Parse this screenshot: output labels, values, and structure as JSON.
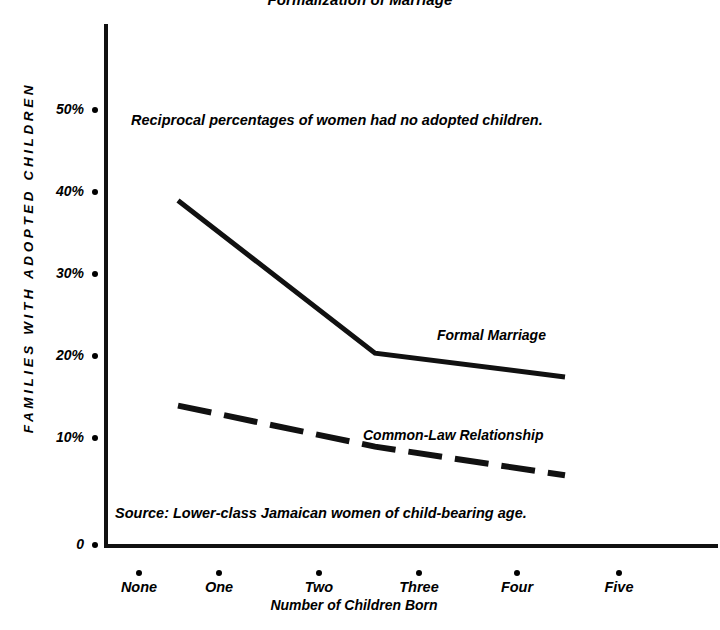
{
  "chart_data": {
    "type": "line",
    "title": "Formalization of Marriage",
    "xlabel": "Number of Children Born",
    "ylabel": "FAMILIES WITH ADOPTED CHILDREN",
    "categories": [
      "None",
      "One",
      "Two",
      "Three",
      "Four",
      "Five"
    ],
    "x_tick_labels": [
      "None",
      "One",
      "Two",
      "Three",
      "Four",
      "Five"
    ],
    "y_tick_labels": [
      "50%",
      "40%",
      "30%",
      "20%",
      "10%",
      "0"
    ],
    "y_tick_values": [
      50,
      40,
      30,
      20,
      10,
      0
    ],
    "ylim": [
      0,
      57
    ],
    "grid": false,
    "legend_position": "inline-labels",
    "series": [
      {
        "name": "Formal Marriage",
        "style": "solid",
        "color": "#111111",
        "x": [
          "None",
          "One",
          "Two",
          "Three",
          "Four",
          "Five"
        ],
        "values": [
          42.0,
          null,
          null,
          23.4,
          null,
          20.5
        ],
        "drawn_points": [
          {
            "category": "None",
            "value": 42.0
          },
          {
            "category": "Three",
            "value": 23.4
          },
          {
            "category": "Five",
            "value": 20.5
          }
        ]
      },
      {
        "name": "Common-Law Relationship",
        "style": "dashed",
        "color": "#111111",
        "x": [
          "None",
          "One",
          "Two",
          "Three",
          "Four",
          "Five"
        ],
        "values": [
          17.0,
          null,
          null,
          12.0,
          null,
          8.5
        ],
        "drawn_points": [
          {
            "category": "None",
            "value": 17.0
          },
          {
            "category": "Three",
            "value": 12.0
          },
          {
            "category": "Five",
            "value": 8.5
          }
        ]
      }
    ],
    "annotations": [
      {
        "name": "reciprocal-note",
        "text": "Reciprocal percentages of women had no adopted children."
      },
      {
        "name": "source-note",
        "text": "Source: Lower-class Jamaican women of child-bearing age."
      }
    ]
  },
  "labels": {
    "title": "Formalization of Marriage",
    "y_axis_title": "FAMILIES WITH ADOPTED CHILDREN",
    "x_axis_title": "Number of Children Born",
    "annotation_note": "Reciprocal percentages of women had no adopted children.",
    "source_note": "Source: Lower-class Jamaican women of child-bearing age.",
    "series_formal": "Formal Marriage",
    "series_common": "Common-Law Relationship",
    "y_ticks": [
      "50%",
      "40%",
      "30%",
      "20%",
      "10%",
      "0"
    ],
    "x_ticks": [
      "None",
      "One",
      "Two",
      "Three",
      "Four",
      "Five"
    ]
  },
  "colors": {
    "ink": "#111111",
    "background": "#ffffff"
  }
}
